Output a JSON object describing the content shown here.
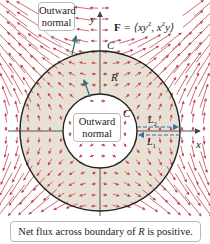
{
  "figure": {
    "field_label_prefix": "F",
    "field_label_eq": " = ⟨xy",
    "field_label_sup1": "2",
    "field_label_mid": ", x",
    "field_label_sup2": "2",
    "field_label_end": "y⟩",
    "outer_curve_label": "C",
    "inner_curve_label": "C",
    "region_label": "R",
    "segment_label_upper": "L",
    "segment_label_upper_sub": "2",
    "segment_label_lower": "L",
    "segment_label_lower_sub": "1",
    "x_axis_label": "x",
    "y_axis_label": "y",
    "outer_normal_callout_line1": "Outward",
    "outer_normal_callout_line2": "normal",
    "inner_normal_callout_line1": "Outward",
    "inner_normal_callout_line2": "normal",
    "caption_prefix": "Net flux across boundary of ",
    "caption_region": "R",
    "caption_suffix": " is positive."
  },
  "colors": {
    "vector_arrows": "#c0465a",
    "region_fill": "#e8e0d3",
    "curve_stroke": "#222222",
    "normal_vector": "#2f7a7a",
    "segment_dashes": "#3a6fa8",
    "axes": "#555555"
  },
  "geometry": {
    "center": [
      100,
      131
    ],
    "outer_radius": 80,
    "inner_radius": 37
  }
}
